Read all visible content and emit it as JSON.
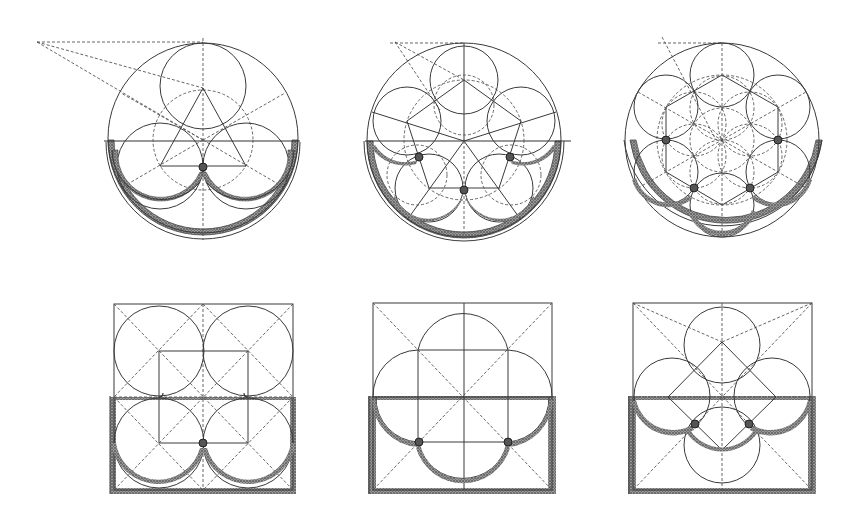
{
  "figure": {
    "title": "",
    "ink_color": "#3a3a3a",
    "hatch_color": "#4a4a4a",
    "background": "#ffffff"
  },
  "diagrams": [
    {
      "id": "trefoil-circle",
      "label": "",
      "frame": "circle",
      "cx": 203,
      "cy": 138,
      "r": 95,
      "lobes": 3,
      "apex": [
        37,
        42
      ]
    },
    {
      "id": "cinquefoil-circle",
      "label": "",
      "frame": "circle",
      "cx": 464,
      "cy": 140,
      "r": 97,
      "lobes": 5,
      "apex": [
        395,
        42
      ]
    },
    {
      "id": "sexfoil-circle",
      "label": "",
      "frame": "circle",
      "cx": 722,
      "cy": 140,
      "r": 97,
      "lobes": 6,
      "apex": [
        662,
        42
      ]
    },
    {
      "id": "quatrefoil-square-a",
      "label": "",
      "frame": "square",
      "x": 114,
      "y": 304,
      "w": 179,
      "h": 186,
      "lobes": 4
    },
    {
      "id": "quatrefoil-square-b",
      "label": "",
      "frame": "square",
      "x": 373,
      "y": 303,
      "w": 179,
      "h": 187,
      "lobes": 4
    },
    {
      "id": "quatrefoil-square-c",
      "label": "",
      "frame": "square",
      "x": 633,
      "y": 303,
      "w": 179,
      "h": 187,
      "lobes": 4
    }
  ]
}
